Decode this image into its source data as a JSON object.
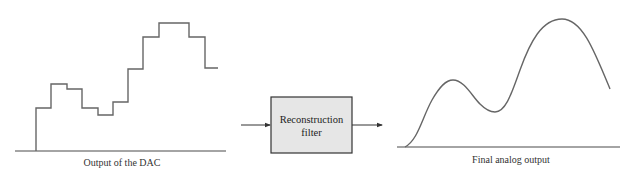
{
  "diagram": {
    "left_panel": {
      "caption": "Output of the DAC",
      "staircase_points": [
        [
          36,
          151
        ],
        [
          36,
          108
        ],
        [
          51,
          108
        ],
        [
          51,
          84
        ],
        [
          67,
          84
        ],
        [
          67,
          89
        ],
        [
          82,
          89
        ],
        [
          82,
          108
        ],
        [
          98,
          108
        ],
        [
          98,
          115
        ],
        [
          113,
          115
        ],
        [
          113,
          102
        ],
        [
          128,
          102
        ],
        [
          128,
          69
        ],
        [
          143,
          69
        ],
        [
          143,
          37
        ],
        [
          159,
          37
        ],
        [
          159,
          23
        ],
        [
          189,
          23
        ],
        [
          189,
          37
        ],
        [
          205,
          37
        ],
        [
          205,
          68
        ],
        [
          218,
          68
        ]
      ]
    },
    "filter_block": {
      "line1": "Reconstruction",
      "line2": "filter",
      "fill": "#e6e6e6"
    },
    "right_panel": {
      "caption": "Final analog output"
    },
    "colors": {
      "line": "#4a4a4a",
      "signal": "#666666"
    }
  }
}
